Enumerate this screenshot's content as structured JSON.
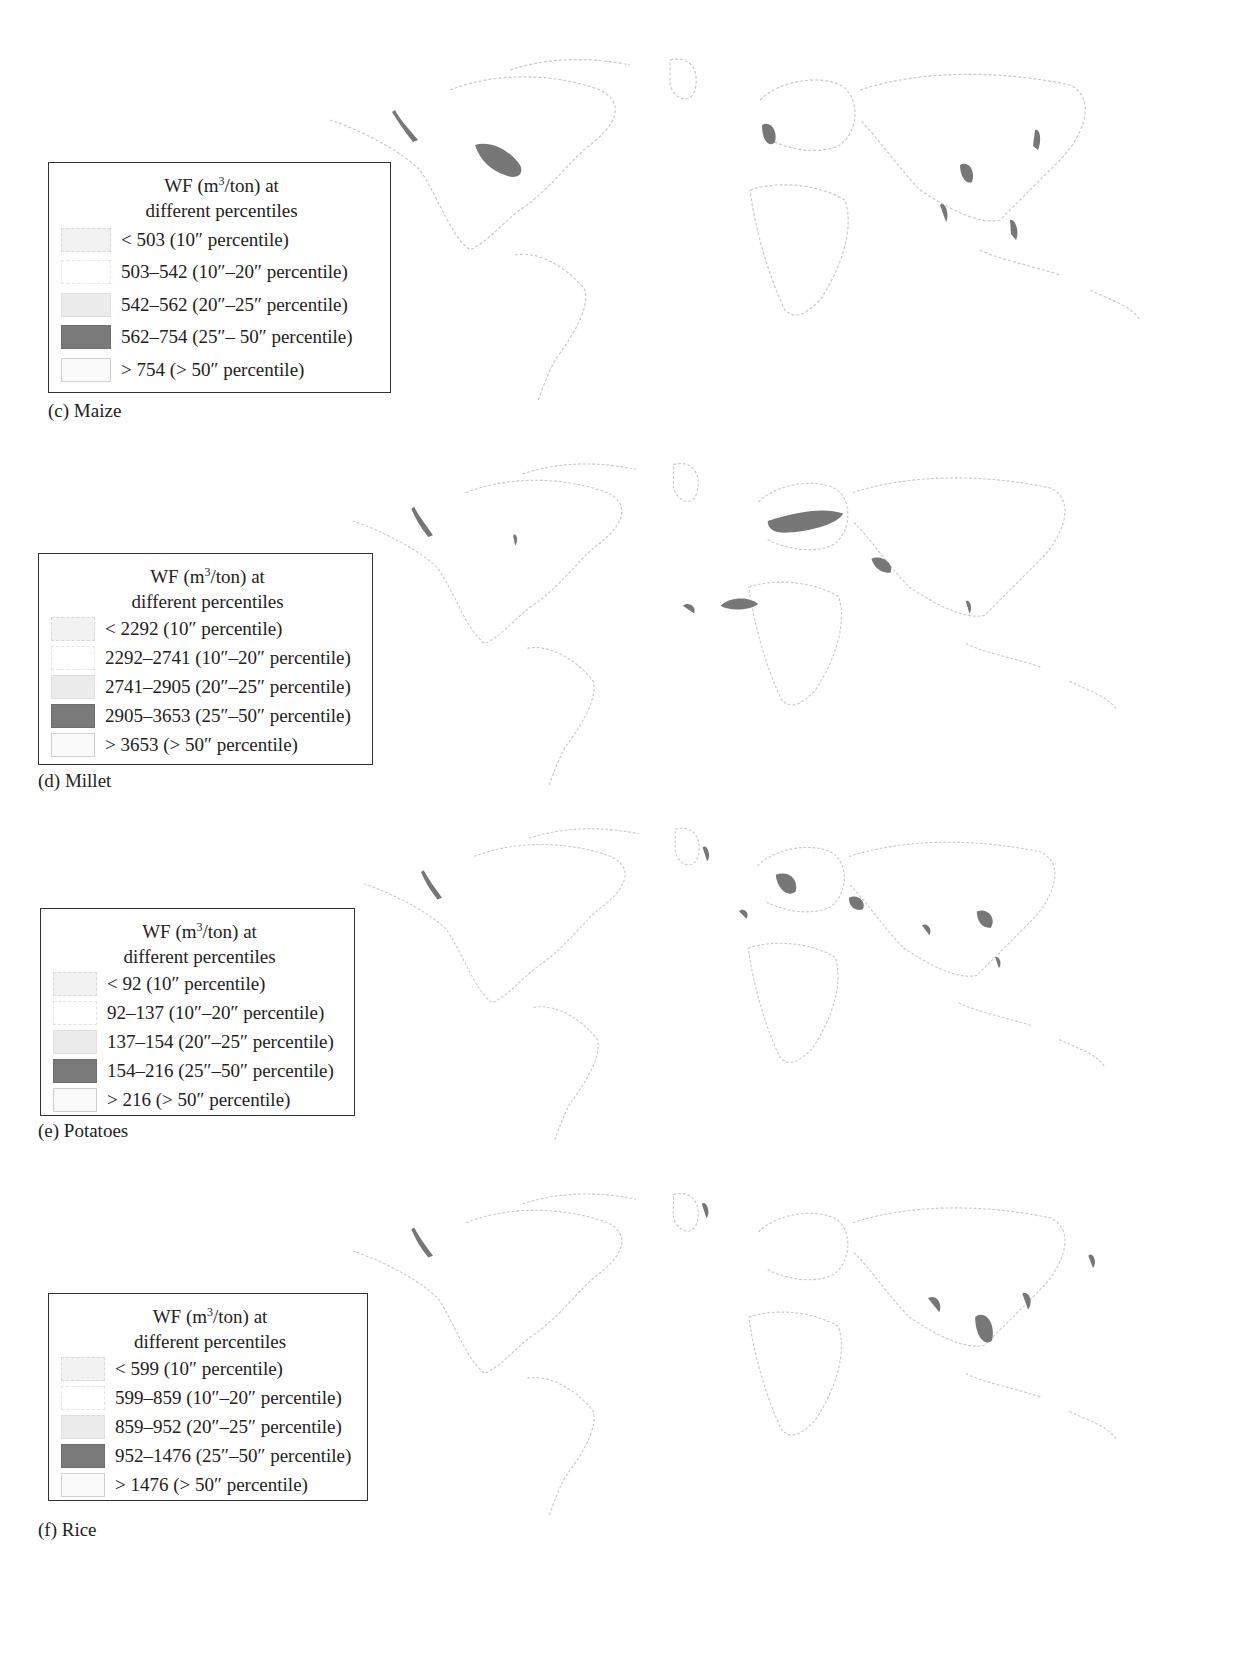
{
  "figure": {
    "panels": [
      {
        "id": "c",
        "caption": "(c) Maize",
        "legend": {
          "title_line1_pre": "WF (m",
          "title_sup": "3",
          "title_line1_post": "/ton) at",
          "title_line2": "different percentiles",
          "items": [
            {
              "label": "< 503 (10″ percentile)",
              "color": "#f2f2f2",
              "border": "#d8d8d8"
            },
            {
              "label": "503–542 (10″–20″ percentile)",
              "color": "#ffffff",
              "border": "#e3e3e3"
            },
            {
              "label": "542–562 (20″–25″ percentile)",
              "color": "#ebebeb",
              "border": "#e0e0e0"
            },
            {
              "label": "562–754 (25″– 50″ percentile)",
              "color": "#7a7a7a",
              "border": "#6e6e6e"
            },
            {
              "label": "> 754 (> 50″ percentile)",
              "color": "#fafafa",
              "border": "#cfcfcf"
            }
          ]
        }
      },
      {
        "id": "d",
        "caption": "(d) Millet",
        "legend": {
          "title_line1_pre": "WF (m",
          "title_sup": "3",
          "title_line1_post": "/ton) at",
          "title_line2": "different percentiles",
          "items": [
            {
              "label": "< 2292 (10″ percentile)",
              "color": "#f2f2f2",
              "border": "#d8d8d8"
            },
            {
              "label": "2292–2741 (10″–20″ percentile)",
              "color": "#ffffff",
              "border": "#e3e3e3"
            },
            {
              "label": "2741–2905 (20″–25″ percentile)",
              "color": "#ebebeb",
              "border": "#e0e0e0"
            },
            {
              "label": "2905–3653 (25″–50″ percentile)",
              "color": "#7a7a7a",
              "border": "#6e6e6e"
            },
            {
              "label": "> 3653 (> 50″ percentile)",
              "color": "#fafafa",
              "border": "#cfcfcf"
            }
          ]
        }
      },
      {
        "id": "e",
        "caption": "(e) Potatoes",
        "legend": {
          "title_line1_pre": "WF (m",
          "title_sup": "3",
          "title_line1_post": "/ton) at",
          "title_line2": "different percentiles",
          "items": [
            {
              "label": "< 92 (10″ percentile)",
              "color": "#f2f2f2",
              "border": "#d8d8d8"
            },
            {
              "label": "92–137 (10″–20″ percentile)",
              "color": "#ffffff",
              "border": "#e3e3e3"
            },
            {
              "label": "137–154 (20″–25″ percentile)",
              "color": "#ebebeb",
              "border": "#e0e0e0"
            },
            {
              "label": "154–216 (25″–50″ percentile)",
              "color": "#7a7a7a",
              "border": "#6e6e6e"
            },
            {
              "label": "> 216 (> 50″ percentile)",
              "color": "#fafafa",
              "border": "#cfcfcf"
            }
          ]
        }
      },
      {
        "id": "f",
        "caption": "(f) Rice",
        "legend": {
          "title_line1_pre": "WF (m",
          "title_sup": "3",
          "title_line1_post": "/ton) at",
          "title_line2": "different percentiles",
          "items": [
            {
              "label": "< 599 (10″ percentile)",
              "color": "#f2f2f2",
              "border": "#d8d8d8"
            },
            {
              "label": "599–859 (10″–20″ percentile)",
              "color": "#ffffff",
              "border": "#e3e3e3"
            },
            {
              "label": "859–952 (20″–25″ percentile)",
              "color": "#ebebeb",
              "border": "#e0e0e0"
            },
            {
              "label": "952–1476 (25″–50″ percentile)",
              "color": "#7a7a7a",
              "border": "#6e6e6e"
            },
            {
              "label": "> 1476 (> 50″ percentile)",
              "color": "#fafafa",
              "border": "#cfcfcf"
            }
          ]
        }
      }
    ]
  }
}
